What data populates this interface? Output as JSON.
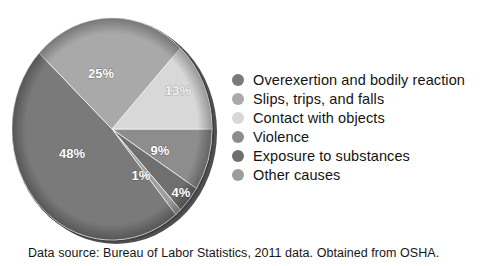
{
  "caption": "Data source: Bureau of Labor Statistics, 2011 data. Obtained from OSHA.",
  "legend": {
    "items": [
      {
        "label": "Overexertion and bodily reaction",
        "color": "#7a7a7a",
        "swatch_name": "legend-swatch-overexertion"
      },
      {
        "label": "Slips, trips, and falls",
        "color": "#a9a9a9",
        "swatch_name": "legend-swatch-slips"
      },
      {
        "label": "Contact with objects",
        "color": "#d8d8d8",
        "swatch_name": "legend-swatch-contact"
      },
      {
        "label": "Violence",
        "color": "#8d8d8d",
        "swatch_name": "legend-swatch-violence"
      },
      {
        "label": "Exposure to substances",
        "color": "#6f6f6f",
        "swatch_name": "legend-swatch-exposure"
      },
      {
        "label": "Other causes",
        "color": "#9d9d9d",
        "swatch_name": "legend-swatch-other"
      }
    ]
  },
  "chart_data": {
    "type": "pie",
    "title": "",
    "subtitle": "",
    "xlabel": "",
    "ylabel": "",
    "grid": false,
    "legend_position": "right",
    "units": "percent",
    "labels_shown_on_slices": true,
    "categories": [
      "Violence",
      "Exposure to substances",
      "Other causes",
      "Overexertion and bodily reaction",
      "Slips, trips, and falls",
      "Contact with objects"
    ],
    "values": [
      9,
      4,
      1,
      48,
      25,
      13
    ],
    "value_labels": [
      "9%",
      "4%",
      "1%",
      "48%",
      "25%",
      "13%"
    ],
    "colors": [
      "#8d8d8d",
      "#6f6f6f",
      "#9d9d9d",
      "#7a7a7a",
      "#a9a9a9",
      "#d8d8d8"
    ],
    "slices": [
      {
        "name": "Violence",
        "value": 9,
        "label": "9%",
        "color": "#8d8d8d"
      },
      {
        "name": "Exposure to substances",
        "value": 4,
        "label": "4%",
        "color": "#6f6f6f"
      },
      {
        "name": "Other causes",
        "value": 1,
        "label": "1%",
        "color": "#9d9d9d"
      },
      {
        "name": "Overexertion and bodily reaction",
        "value": 48,
        "label": "48%",
        "color": "#7a7a7a"
      },
      {
        "name": "Slips, trips, and falls",
        "value": 25,
        "label": "25%",
        "color": "#a9a9a9"
      },
      {
        "name": "Contact with objects",
        "value": 13,
        "label": "13%",
        "color": "#d8d8d8"
      }
    ],
    "total": 100,
    "start_angle_deg": 0,
    "direction": "clockwise"
  },
  "slice_label_positions": {
    "9%": {
      "x": 160,
      "y": 155
    },
    "4%": {
      "x": 181,
      "y": 197
    },
    "1%": {
      "x": 141,
      "y": 180
    },
    "48%": {
      "x": 72,
      "y": 158
    },
    "25%": {
      "x": 101,
      "y": 78
    },
    "13%": {
      "x": 178,
      "y": 95
    }
  }
}
